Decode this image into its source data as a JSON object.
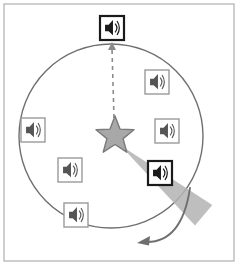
{
  "figure": {
    "title": "Sound source rotation diagram",
    "background_color": "#ffffff",
    "frame": {
      "stroke": "#b0b0b0",
      "stroke_width": 1.2,
      "inset": 4,
      "fill": "#ffffff"
    }
  },
  "circle": {
    "label": "listener-ring",
    "center_x": 111,
    "center_y": 136,
    "radius": 92,
    "stroke": "#6f6f6f",
    "stroke_width": 1.4,
    "fill": "none"
  },
  "star": {
    "label": "sound-source-star",
    "center_x": 115,
    "center_y": 136,
    "outer_radius": 20,
    "inner_radius": 8.5,
    "fill": "#a8a8a8",
    "stroke": "#7a7a7a",
    "stroke_width": 1.4,
    "points": 5
  },
  "beam": {
    "label": "active-speaker-beam",
    "fill": "#b3b3b3",
    "opacity": 0.85,
    "origin_x": 120,
    "origin_y": 145,
    "half_angle_deg": 7,
    "direction_deg": 40,
    "length": 110
  },
  "dashed_arrow": {
    "label": "reference-direction",
    "from_x": 114,
    "from_y": 118,
    "to_x": 112,
    "to_y": 44,
    "stroke": "#8a8a8a",
    "stroke_width": 1.6,
    "dash": "4 4",
    "arrowhead": "top"
  },
  "curved_arrow": {
    "label": "rotation-direction",
    "stroke": "#6f6f6f",
    "stroke_width": 1.8,
    "direction": "counterclockwise",
    "start_x": 190,
    "start_y": 188,
    "end_x": 141,
    "end_y": 240
  },
  "speakers": [
    {
      "id": "speaker-top",
      "name": "speaker-top-highlighted",
      "x": 112,
      "y": 28,
      "size": 24,
      "state": "highlighted",
      "border_color": "#1a1a1a",
      "border_width": 2.2,
      "glyph_color": "#1a1a1a",
      "fill": "#ffffff"
    },
    {
      "id": "speaker-upper-right",
      "name": "speaker-upper-right",
      "x": 157,
      "y": 82,
      "size": 24,
      "state": "inactive",
      "border_color": "#9a9a9a",
      "border_width": 1.4,
      "glyph_color": "#555555",
      "fill": "#ffffff"
    },
    {
      "id": "speaker-right",
      "name": "speaker-right",
      "x": 167,
      "y": 131,
      "size": 24,
      "state": "inactive",
      "border_color": "#9a9a9a",
      "border_width": 1.4,
      "glyph_color": "#555555",
      "fill": "#ffffff"
    },
    {
      "id": "speaker-lower-right",
      "name": "speaker-lower-right-active",
      "x": 160,
      "y": 173,
      "size": 24,
      "state": "active",
      "border_color": "#1a1a1a",
      "border_width": 2.2,
      "glyph_color": "#1a1a1a",
      "fill": "#ffffff"
    },
    {
      "id": "speaker-lower-left",
      "name": "speaker-lower-left",
      "x": 70,
      "y": 170,
      "size": 24,
      "state": "inactive",
      "border_color": "#9a9a9a",
      "border_width": 1.4,
      "glyph_color": "#555555",
      "fill": "#ffffff"
    },
    {
      "id": "speaker-bottom-left",
      "name": "speaker-bottom-left",
      "x": 76,
      "y": 215,
      "size": 24,
      "state": "inactive",
      "border_color": "#9a9a9a",
      "border_width": 1.4,
      "glyph_color": "#555555",
      "fill": "#ffffff"
    },
    {
      "id": "speaker-left",
      "name": "speaker-left",
      "x": 33,
      "y": 130,
      "size": 24,
      "state": "inactive",
      "border_color": "#9a9a9a",
      "border_width": 1.4,
      "glyph_color": "#555555",
      "fill": "#ffffff"
    }
  ],
  "icon_names": {
    "speaker": "speaker-icon",
    "star": "star-icon",
    "arrow_up": "arrow-up-icon",
    "arrow_curved": "curved-arrow-icon"
  }
}
